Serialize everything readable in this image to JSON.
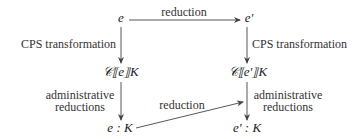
{
  "diagram": {
    "nodes": {
      "top_left": "e",
      "top_right": "e′",
      "mid_left": "𝒞⟦e⟧K",
      "mid_right": "𝒞⟦e′⟧K",
      "bot_left": "e : K",
      "bot_right": "e′ : K"
    },
    "edges": {
      "top_reduction": "reduction",
      "left_cps": "CPS transformation",
      "right_cps": "CPS transformation",
      "left_admin_line1": "administrative",
      "left_admin_line2": "reductions",
      "right_admin_line1": "administrative",
      "right_admin_line2": "reductions",
      "diag_reduction": "reduction"
    },
    "colors": {
      "line": "#444444",
      "text": "#222222"
    }
  }
}
